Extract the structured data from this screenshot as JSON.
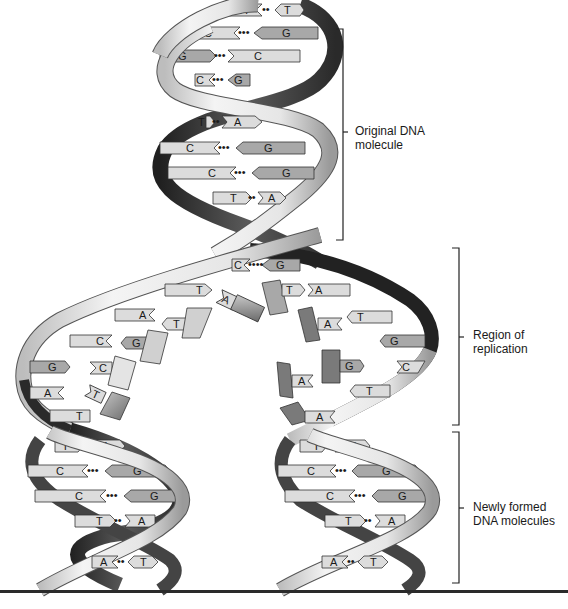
{
  "figure": {
    "labels": {
      "original": [
        "Original DNA",
        "molecule"
      ],
      "replication": [
        "Region of",
        "replication"
      ],
      "newly_formed": [
        "Newly formed",
        "DNA molecules"
      ]
    },
    "colors": {
      "strand_light": "#e8e8e8",
      "strand_dark": "#3a3a3a",
      "base_light": "#dcdcdc",
      "base_mid": "#a8a8a8",
      "base_dark": "#7a7a7a",
      "outline": "#333333",
      "bracket": "#222222"
    },
    "original_molecule": {
      "base_pairs": [
        {
          "left": "A",
          "right": "T",
          "y": 10,
          "x1": 228,
          "x2": 300
        },
        {
          "left": "C",
          "right": "G",
          "y": 33,
          "x1": 180,
          "x2": 318
        },
        {
          "left": "G",
          "right": "C",
          "y": 56,
          "x1": 160,
          "x2": 315
        },
        {
          "left": "C",
          "right": "G",
          "y": 80,
          "x1": 195,
          "x2": 270
        },
        {
          "left": "T",
          "right": "A",
          "y": 122,
          "x1": 210,
          "x2": 270
        },
        {
          "left": "C",
          "right": "G",
          "y": 148,
          "x1": 160,
          "x2": 318
        },
        {
          "left": "C",
          "right": "G",
          "y": 173,
          "x1": 168,
          "x2": 318
        },
        {
          "left": "T",
          "right": "A",
          "y": 198,
          "x1": 213,
          "x2": 285
        }
      ]
    },
    "replication_region": {
      "left_template": [
        "T",
        "A",
        "C",
        "G",
        "A",
        "T"
      ],
      "left_free_nucleotides": [
        "A",
        "T",
        "G",
        "C",
        "T"
      ],
      "right_template": [
        "A",
        "T",
        "G",
        "C",
        "T"
      ],
      "right_free_nucleotides": [
        "T",
        "A",
        "G",
        "A",
        "A"
      ],
      "fork_pair": {
        "left": "C",
        "right": "G"
      }
    },
    "new_molecules": [
      {
        "name": "left",
        "base_pairs": [
          {
            "left": "T",
            "right": "A"
          },
          {
            "left": "C",
            "right": "G"
          },
          {
            "left": "C",
            "right": "G"
          },
          {
            "left": "T",
            "right": "A"
          },
          {
            "left": "A",
            "right": "T"
          }
        ]
      },
      {
        "name": "right",
        "base_pairs": [
          {
            "left": "T",
            "right": "A"
          },
          {
            "left": "C",
            "right": "G"
          },
          {
            "left": "C",
            "right": "G"
          },
          {
            "left": "T",
            "right": "A"
          },
          {
            "left": "A",
            "right": "T"
          }
        ]
      }
    ]
  }
}
